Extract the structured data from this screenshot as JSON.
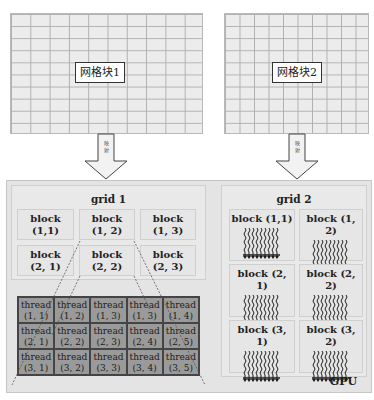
{
  "top_grids": [
    {
      "label": "网格块1",
      "columns": 10,
      "rows": 10
    },
    {
      "label": "网格块2",
      "columns": 10,
      "rows": 10
    }
  ],
  "arrows": [
    {
      "label": "映射"
    },
    {
      "label": "映射"
    }
  ],
  "gpu": {
    "label": "GPU",
    "grid1": {
      "title": "grid 1",
      "blocks": [
        {
          "name": "block",
          "coord": "(1,1)"
        },
        {
          "name": "block",
          "coord": "(1, 2)"
        },
        {
          "name": "block",
          "coord": "(1, 3)"
        },
        {
          "name": "block",
          "coord": "(2, 1)"
        },
        {
          "name": "block",
          "coord": "(2, 2)"
        },
        {
          "name": "block",
          "coord": "(2, 3)"
        }
      ],
      "threads": [
        {
          "name": "thread",
          "coord": "(1, 1)"
        },
        {
          "name": "thread",
          "coord": "(1, 2)"
        },
        {
          "name": "thread",
          "coord": "(1, 3)"
        },
        {
          "name": "thread",
          "coord": "(1, 3)"
        },
        {
          "name": "thread",
          "coord": "(1, 4)"
        },
        {
          "name": "thread",
          "coord": "(2, 1)"
        },
        {
          "name": "thread",
          "coord": "(2, 2)"
        },
        {
          "name": "thread",
          "coord": "(2, 3)"
        },
        {
          "name": "thread",
          "coord": "(2, 4)"
        },
        {
          "name": "thread",
          "coord": "(2, 5)"
        },
        {
          "name": "thread",
          "coord": "(3, 1)"
        },
        {
          "name": "thread",
          "coord": "(3, 2)"
        },
        {
          "name": "thread",
          "coord": "(3, 3)"
        },
        {
          "name": "thread",
          "coord": "(3, 4)"
        },
        {
          "name": "thread",
          "coord": "(3, 5)"
        }
      ]
    },
    "grid2": {
      "title": "grid 2",
      "blocks": [
        {
          "label": "block (1,1)"
        },
        {
          "label": "block (1, 2)"
        },
        {
          "label": "block (2, 1)"
        },
        {
          "label": "block (2, 2)"
        },
        {
          "label": "block (3, 1)"
        },
        {
          "label": "block (3, 2)"
        }
      ]
    }
  },
  "colors": {
    "page_bg": "#ffffff",
    "top_grid_fill": "#ececec",
    "gpu_fill": "#e4e4e4",
    "thread_fill": "#9a9a9a",
    "line": "#444444"
  }
}
